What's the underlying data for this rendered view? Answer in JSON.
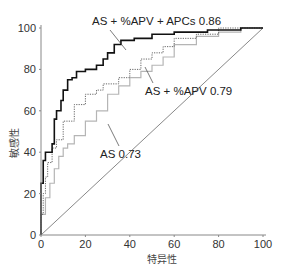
{
  "chart_data": {
    "type": "line",
    "title": "",
    "xlabel": "特异性",
    "ylabel": "敏感性",
    "xlim": [
      0,
      100
    ],
    "ylim": [
      0,
      100
    ],
    "x_ticks": [
      0,
      20,
      40,
      60,
      80,
      100
    ],
    "y_ticks": [
      0,
      20,
      40,
      60,
      80,
      100
    ],
    "grid": false,
    "legend": "inline annotations",
    "series": [
      {
        "name": "AS + %APV + APCs 0.86",
        "style": "solid-black",
        "x": [
          0,
          0,
          1,
          2,
          5,
          6,
          7,
          9,
          10,
          12,
          14,
          16,
          20,
          25,
          28,
          30,
          33,
          36,
          42,
          50,
          60,
          75,
          90,
          100
        ],
        "y": [
          0,
          10,
          25,
          36,
          40,
          44,
          56,
          60,
          65,
          70,
          75,
          76,
          79,
          80,
          82,
          85,
          88,
          92,
          94,
          95,
          97,
          98,
          99,
          100
        ]
      },
      {
        "name": "AS + %APV 0.79",
        "style": "dotted-dark",
        "x": [
          0,
          1,
          2,
          3,
          5,
          7,
          10,
          15,
          20,
          25,
          28,
          35,
          40,
          45,
          50,
          55,
          60,
          70,
          80,
          100
        ],
        "y": [
          0,
          10,
          20,
          28,
          35,
          42,
          46,
          55,
          63,
          68,
          70,
          73,
          76,
          80,
          85,
          88,
          91,
          95,
          97,
          100
        ]
      },
      {
        "name": "AS 0.73",
        "style": "light-gray",
        "x": [
          0,
          2,
          4,
          6,
          8,
          10,
          12,
          15,
          20,
          25,
          30,
          35,
          40,
          45,
          50,
          55,
          60,
          70,
          80,
          90,
          100
        ],
        "y": [
          0,
          10,
          18,
          25,
          32,
          38,
          42,
          44,
          48,
          55,
          60,
          68,
          72,
          76,
          79,
          82,
          86,
          92,
          96,
          98,
          100
        ]
      },
      {
        "name": "reference",
        "style": "thin-diagonal",
        "x": [
          0,
          100
        ],
        "y": [
          0,
          100
        ]
      }
    ],
    "annotations": [
      {
        "text": "AS + %APV + APCs 0.86",
        "x": 27,
        "y": 107
      },
      {
        "text": "AS + %APV 0.79",
        "x": 61,
        "y": 64
      },
      {
        "text": "AS 0.73",
        "x": 36,
        "y": 40
      }
    ]
  },
  "labels": {
    "x_axis": "特异性",
    "y_axis": "敏感性",
    "ann_black": "AS + %APV + APCs 0.86",
    "ann_dotted": "AS + %APV 0.79",
    "ann_gray": "AS 0.73",
    "ticks": [
      "0",
      "20",
      "40",
      "60",
      "80",
      "100"
    ]
  },
  "colors": {
    "black_curve": "#111111",
    "dotted_curve": "#666666",
    "gray_curve": "#b5b5b5",
    "axis": "#888888",
    "diagonal": "#555555"
  }
}
